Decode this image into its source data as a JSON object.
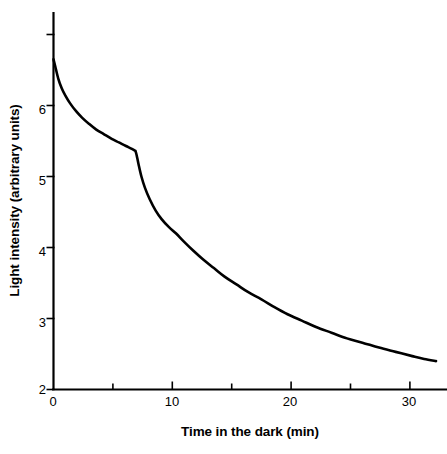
{
  "chart_data": {
    "type": "line",
    "title": "",
    "xlabel": "Time in the dark (min)",
    "ylabel": "Light intensity (arbitrary units)",
    "xlim": [
      0,
      32.5
    ],
    "ylim": [
      2,
      7
    ],
    "grid": false,
    "legend": null,
    "xticks_major": [
      0,
      10,
      20,
      30
    ],
    "xtick_labels": [
      "0",
      "10",
      "20",
      "30"
    ],
    "xticks_minor": [
      5,
      15,
      25
    ],
    "yticks_major": [
      2,
      3,
      4,
      5,
      6,
      7
    ],
    "ytick_labels": [
      "2",
      "3",
      "4",
      "5",
      "6",
      ""
    ],
    "line_color": "#000000",
    "line_width": 2.6,
    "series": [
      {
        "name": "Light intensity decay in the dark",
        "x": [
          0.0,
          0.15,
          0.4,
          0.7,
          1.0,
          1.4,
          1.9,
          2.4,
          3.0,
          3.6,
          4.2,
          4.9,
          5.5,
          6.1,
          6.6,
          6.9,
          7.0,
          7.15,
          7.4,
          7.7,
          8.1,
          8.6,
          9.1,
          9.7,
          10.3,
          11.0,
          11.8,
          12.6,
          13.5,
          14.4,
          15.4,
          16.4,
          17.5,
          18.6,
          19.7,
          20.9,
          22.1,
          23.4,
          24.7,
          26.0,
          27.4,
          28.8,
          30.2,
          31.2,
          32.2
        ],
        "y": [
          6.65,
          6.55,
          6.38,
          6.24,
          6.14,
          6.03,
          5.92,
          5.83,
          5.74,
          5.66,
          5.6,
          5.53,
          5.48,
          5.43,
          5.39,
          5.36,
          5.3,
          5.18,
          5.0,
          4.84,
          4.68,
          4.52,
          4.4,
          4.29,
          4.2,
          4.08,
          3.95,
          3.83,
          3.71,
          3.59,
          3.48,
          3.37,
          3.27,
          3.16,
          3.06,
          2.97,
          2.88,
          2.8,
          2.72,
          2.66,
          2.59,
          2.53,
          2.47,
          2.43,
          2.4
        ]
      }
    ],
    "annotations": [
      {
        "text": "abrupt break in slope near 7 min",
        "x": 6.95,
        "y": 5.33
      }
    ]
  },
  "axes": {
    "x_axis_name": "time-axis",
    "y_axis_name": "intensity-axis"
  }
}
